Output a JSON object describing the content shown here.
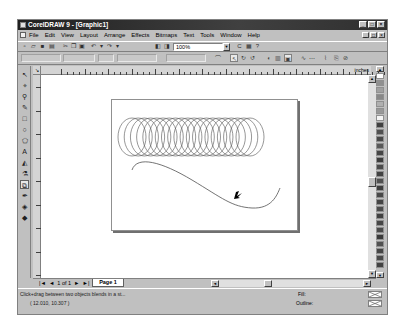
{
  "window": {
    "title": "CorelDRAW 9 - [Graphic1]",
    "controls": {
      "minimize": "_",
      "maximize": "□",
      "close": "×"
    }
  },
  "menubar": {
    "items": [
      "File",
      "Edit",
      "View",
      "Layout",
      "Arrange",
      "Effects",
      "Bitmaps",
      "Text",
      "Tools",
      "Window",
      "Help"
    ],
    "doc_controls": {
      "minimize": "_",
      "restore": "□",
      "close": "×"
    }
  },
  "toolbar": {
    "icons": [
      {
        "name": "new-icon",
        "glyph": "▫"
      },
      {
        "name": "open-icon",
        "glyph": "▱"
      },
      {
        "name": "save-icon",
        "glyph": "■"
      },
      {
        "name": "print-icon",
        "glyph": "▤"
      },
      {
        "name": "cut-icon",
        "glyph": "✂"
      },
      {
        "name": "copy-icon",
        "glyph": "❐"
      },
      {
        "name": "paste-icon",
        "glyph": "▣"
      },
      {
        "name": "undo-icon",
        "glyph": "↶"
      },
      {
        "name": "undo-dropdown-icon",
        "glyph": "▾"
      },
      {
        "name": "redo-icon",
        "glyph": "↷"
      },
      {
        "name": "redo-dropdown-icon",
        "glyph": "▾"
      },
      {
        "name": "import-icon",
        "glyph": "◧"
      },
      {
        "name": "export-icon",
        "glyph": "◨"
      }
    ],
    "zoom_level": "100%",
    "right_icons": [
      {
        "name": "corel-online-icon",
        "glyph": "C"
      },
      {
        "name": "application-launcher-icon",
        "glyph": "▦"
      },
      {
        "name": "whats-this-icon",
        "glyph": "?"
      }
    ]
  },
  "propbar": {
    "icons": [
      {
        "name": "blend-preset-icon",
        "glyph": "⌒"
      },
      {
        "name": "blend-direct-icon",
        "glyph": "↖"
      },
      {
        "name": "blend-clockwise-icon",
        "glyph": "↻"
      },
      {
        "name": "blend-counterclockwise-icon",
        "glyph": "↺"
      },
      {
        "name": "object-color-accel-icon",
        "glyph": "◐"
      },
      {
        "name": "blend-options-icon",
        "glyph": "▥"
      },
      {
        "name": "start-end-props-icon",
        "glyph": "▣"
      },
      {
        "name": "path-properties-icon",
        "glyph": "∿"
      },
      {
        "name": "fuse-icon",
        "glyph": "⋯"
      },
      {
        "name": "split-icon",
        "glyph": "⌇"
      },
      {
        "name": "copy-blend-icon",
        "glyph": "⎘"
      },
      {
        "name": "clear-blend-icon",
        "glyph": "⊘"
      }
    ]
  },
  "toolbox": {
    "tools": [
      {
        "name": "pick-tool-icon",
        "glyph": "↖"
      },
      {
        "name": "shape-tool-icon",
        "glyph": "⌖"
      },
      {
        "name": "zoom-tool-icon",
        "glyph": "⚲"
      },
      {
        "name": "freehand-tool-icon",
        "glyph": "✎"
      },
      {
        "name": "rectangle-tool-icon",
        "glyph": "□"
      },
      {
        "name": "ellipse-tool-icon",
        "glyph": "○"
      },
      {
        "name": "polygon-tool-icon",
        "glyph": "⬠"
      },
      {
        "name": "text-tool-icon",
        "glyph": "A"
      },
      {
        "name": "interactive-fill-icon",
        "glyph": "◭"
      },
      {
        "name": "eyedropper-icon",
        "glyph": "⚗"
      },
      {
        "name": "interactive-blend-icon",
        "glyph": "⧉"
      },
      {
        "name": "outline-tool-icon",
        "glyph": "✒"
      },
      {
        "name": "fill-tool-icon",
        "glyph": "◈"
      },
      {
        "name": "interactive-fill-tool-icon",
        "glyph": "◆"
      }
    ],
    "active_index": 10
  },
  "ruler": {
    "units": "inches",
    "labels": [
      "1",
      "2",
      "3",
      "4",
      "5",
      "6",
      "7",
      "8",
      "9",
      "10",
      "11",
      "12",
      "13",
      "14"
    ]
  },
  "palette": {
    "colors": [
      "#909090",
      "#a0a0a0",
      "#888888",
      "#b0b0b0",
      "#989898",
      "#f4f4f4",
      "#404040",
      "#505050",
      "#484848",
      "#585858",
      "#454545",
      "#3c3c3c",
      "#4a4a4a",
      "#424242",
      "#505050",
      "#3e3e3e",
      "#484848",
      "#444444",
      "#4c4c4c",
      "#404040",
      "#464646",
      "#4a4a4a",
      "#3a3a3a",
      "#505050",
      "#444444",
      "#484848",
      "#424242"
    ]
  },
  "navigation": {
    "first_label": "|◄",
    "prev_label": "◄",
    "page_count": "1 of 1",
    "next_label": "►",
    "last_label": "►|",
    "page_tab": "Page 1"
  },
  "status": {
    "hint": "Click+drag between two objects blends in a st...",
    "coordinates": "( 12.010, 10.307 )",
    "fill_label": "Fill:",
    "outline_label": "Outline:"
  },
  "drawing": {
    "blend_steps": 20,
    "stroke_color": "#505050"
  }
}
